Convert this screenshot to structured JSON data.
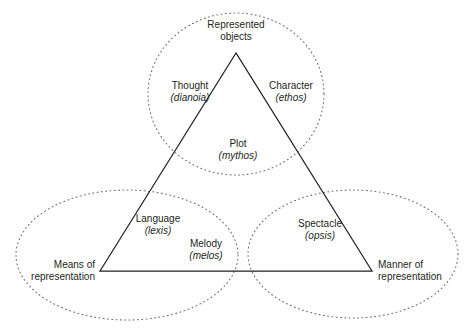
{
  "diagram": {
    "background_color": "#ffffff",
    "line_color": "#231f20",
    "dot_color": "#6d6e71",
    "text_color": "#231f20",
    "vertices": {
      "top": {
        "line1": "Represented",
        "line2": "objects"
      },
      "bottom_left": {
        "line1": "Means of",
        "line2": "representation"
      },
      "bottom_right": {
        "line1": "Manner of",
        "line2": "representation"
      }
    },
    "elements": [
      {
        "id": "thought",
        "term": "Thought",
        "greek": "(dianoia)"
      },
      {
        "id": "character",
        "term": "Character",
        "greek": "(ethos)"
      },
      {
        "id": "plot",
        "term": "Plot",
        "greek": "(mythos)"
      },
      {
        "id": "language",
        "term": "Language",
        "greek": "(lexis)"
      },
      {
        "id": "melody",
        "term": "Melody",
        "greek": "(melos)"
      },
      {
        "id": "spectacle",
        "term": "Spectacle",
        "greek": "(opsis)"
      }
    ]
  }
}
